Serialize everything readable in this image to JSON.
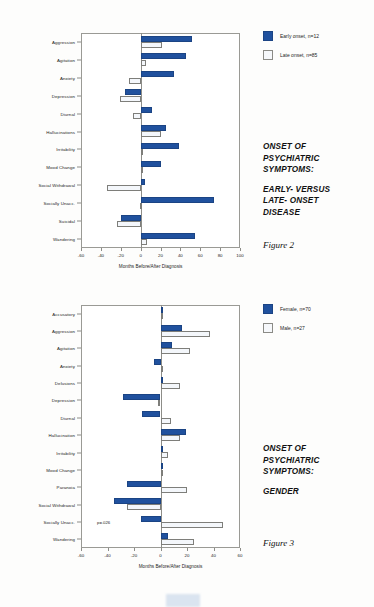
{
  "figures": [
    {
      "id": "figure-2",
      "fig_number": "Figure 2",
      "caption_line_1": "ONSET OF",
      "caption_line_2": "PSYCHIATRIC",
      "caption_line_3": "SYMPTOMS:",
      "caption_line_4": "EARLY- VERSUS",
      "caption_line_5": "LATE- ONSET",
      "caption_line_6": "DISEASE",
      "legend": [
        {
          "label": "Early onset, n=12",
          "color": "#20519e",
          "style": "dark"
        },
        {
          "label": "Late onset, n=85",
          "color": "#f6f8fb",
          "style": "light"
        }
      ],
      "chart_data": {
        "type": "bar",
        "orientation": "horizontal",
        "title": "ONSET OF PSYCHIATRIC SYMPTOMS: EARLY- VERSUS LATE- ONSET DISEASE",
        "xlabel": "Months Before/After Diagnosis",
        "ylabel": "",
        "xlim": [
          -60,
          100
        ],
        "xticks": [
          -60,
          -40,
          -20,
          0,
          20,
          40,
          60,
          80,
          100
        ],
        "xtick_labels": [
          "-60",
          "-40",
          "-20",
          "0",
          "20",
          "40",
          "60",
          "80",
          "100"
        ],
        "grid": false,
        "legend_position": "top-right",
        "categories": [
          "Aggression",
          "Agitation",
          "Anxiety",
          "Depression",
          "Diurnal",
          "Hallucinations",
          "Irritability",
          "Mood Change",
          "Social Withdrawal",
          "Socially Unacc.",
          "Suicidal",
          "Wandering"
        ],
        "series": [
          {
            "name": "Early onset, n=12",
            "color": "#20519e",
            "values": [
              52,
              46,
              34,
              -16,
              11,
              26,
              39,
              20,
              4,
              74,
              -20,
              55
            ]
          },
          {
            "name": "Late onset, n=85",
            "color": "#f6f8fb",
            "values": [
              22,
              5,
              -12,
              -21,
              -8,
              20,
              2,
              1,
              -34,
              -1,
              -24,
              6
            ]
          }
        ]
      }
    },
    {
      "id": "figure-3",
      "fig_number": "Figure 3",
      "caption_line_1": "ONSET OF",
      "caption_line_2": "PSYCHIATRIC",
      "caption_line_3": "SYMPTOMS:",
      "caption_line_4": "GENDER",
      "legend": [
        {
          "label": "Female, n=70",
          "color": "#20519e",
          "style": "dark"
        },
        {
          "label": "Male, n=27",
          "color": "#f6f8fb",
          "style": "light"
        }
      ],
      "annotation": "p=.026",
      "chart_data": {
        "type": "bar",
        "orientation": "horizontal",
        "title": "ONSET OF PSYCHIATRIC SYMPTOMS: GENDER",
        "xlabel": "Months Before/After Diagnosis",
        "ylabel": "",
        "xlim": [
          -60,
          60
        ],
        "xticks": [
          -60,
          -40,
          -20,
          0,
          20,
          40,
          60
        ],
        "xtick_labels": [
          "-60",
          "-40",
          "-20",
          "0",
          "20",
          "40",
          "60"
        ],
        "grid": false,
        "legend_position": "top-right",
        "annotations": [
          {
            "text": "p=.026",
            "category": "Socially Unacc."
          }
        ],
        "categories": [
          "Accusatory",
          "Aggression",
          "Agitation",
          "Anxiety",
          "Delusions",
          "Depression",
          "Diurnal",
          "Hallucination",
          "Irritability",
          "Mood Change",
          "Paranoia",
          "Social Withdrawal",
          "Socially Unacc.",
          "Wandering"
        ],
        "series": [
          {
            "name": "Female, n=70",
            "color": "#20519e",
            "values": [
              1,
              16,
              9,
              -5,
              0,
              -28,
              -14,
              19,
              2,
              1,
              -25,
              -35,
              -15,
              6
            ]
          },
          {
            "name": "Male, n=27",
            "color": "#f6f8fb",
            "values": [
              2,
              37,
              22,
              2,
              15,
              -2,
              8,
              15,
              6,
              2,
              20,
              -25,
              47,
              25
            ]
          }
        ]
      }
    }
  ]
}
